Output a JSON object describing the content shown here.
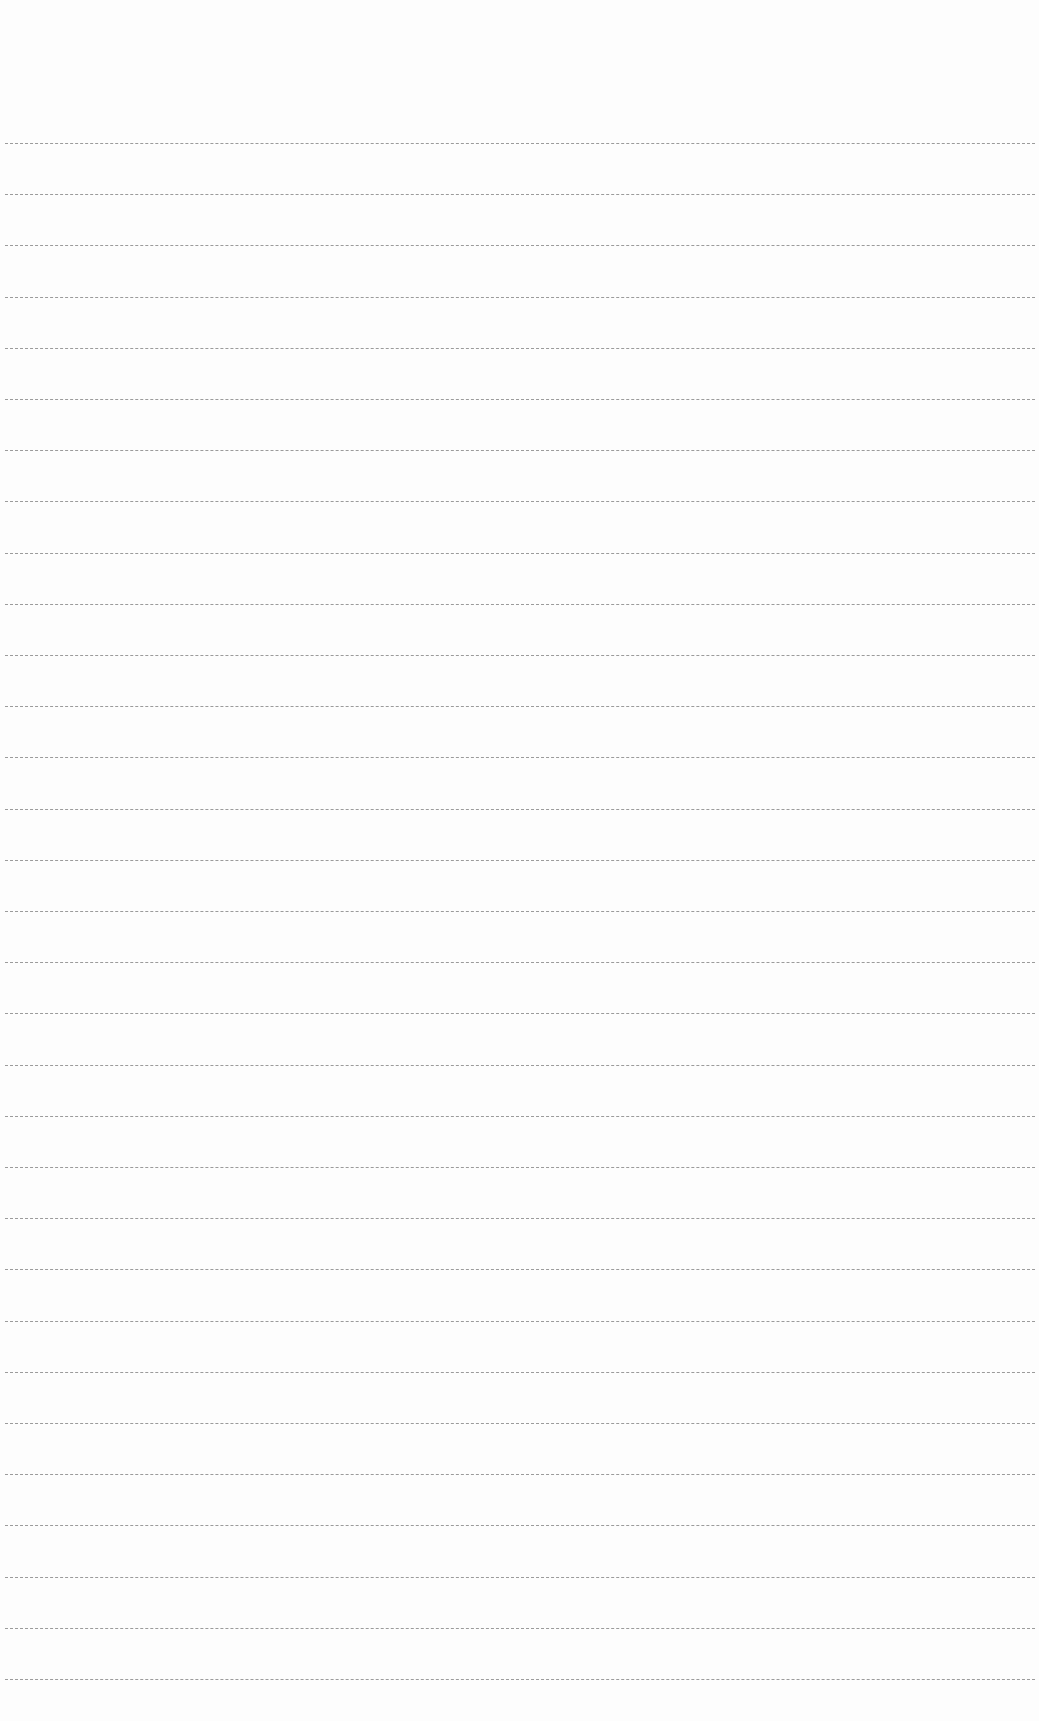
{
  "page": {
    "type": "ruled-paper",
    "background_color": "#fdfdfd",
    "rule_color": "#8a8a8a",
    "rule_count": 31,
    "first_rule_y": 143,
    "rule_spacing": 51.2,
    "rule_left": 5,
    "rule_right": 1035,
    "content_text": ""
  }
}
